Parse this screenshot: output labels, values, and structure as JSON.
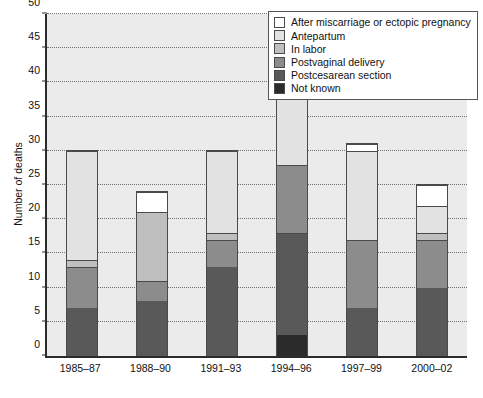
{
  "chart_data": {
    "type": "bar",
    "subtype": "stacked",
    "title": "",
    "xlabel": "",
    "ylabel": "Number of deaths",
    "ylim": [
      0,
      50
    ],
    "ytick_step": 5,
    "yticks": [
      0,
      5,
      10,
      15,
      20,
      25,
      30,
      35,
      40,
      45,
      50
    ],
    "grid": "horizontal-dotted",
    "legend_position": "top-right",
    "categories": [
      "1985–87",
      "1988–90",
      "1991–93",
      "1994–96",
      "1997–99",
      "2000–02"
    ],
    "series": [
      {
        "name": "Not known",
        "color": "#2b2b2b",
        "values": [
          0,
          0,
          0,
          3,
          0,
          0
        ]
      },
      {
        "name": "Postcesarean section",
        "color": "#595959",
        "values": [
          7,
          8,
          13,
          15,
          7,
          10
        ]
      },
      {
        "name": "Postvaginal delivery",
        "color": "#8c8c8c",
        "values": [
          6,
          3,
          4,
          10,
          10,
          7
        ]
      },
      {
        "name": "In labor",
        "color": "#bfbfbf",
        "values": [
          1,
          10,
          1,
          0,
          0,
          1
        ]
      },
      {
        "name": "Antepartum",
        "color": "#e2e2e2",
        "values": [
          16,
          0,
          12,
          15,
          13,
          4
        ]
      },
      {
        "name": "After miscarriage or ectopic pregnancy",
        "color": "#ffffff",
        "values": [
          0,
          3,
          0,
          3,
          1,
          3
        ]
      }
    ],
    "stack_order_bottom_to_top": [
      "Not known",
      "Postcesarean section",
      "Postvaginal delivery",
      "In labor",
      "Antepartum",
      "After miscarriage or ectopic pregnancy"
    ],
    "totals": [
      30,
      24,
      30,
      46,
      31,
      25
    ]
  },
  "legend": {
    "items": [
      {
        "label": "After miscarriage or ectopic pregnancy",
        "color": "#ffffff"
      },
      {
        "label": "Antepartum",
        "color": "#e2e2e2"
      },
      {
        "label": "In labor",
        "color": "#bfbfbf"
      },
      {
        "label": "Postvaginal delivery",
        "color": "#8c8c8c"
      },
      {
        "label": "Postcesarean section",
        "color": "#595959"
      },
      {
        "label": "Not known",
        "color": "#2b2b2b"
      }
    ]
  }
}
